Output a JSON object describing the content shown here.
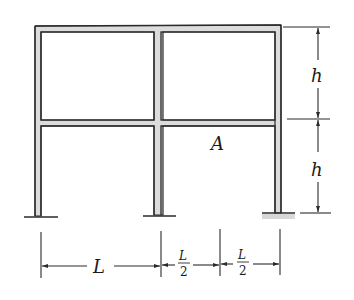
{
  "figure": {
    "type": "two-story two-bay portal frame",
    "colors": {
      "line": "#2a2a2a",
      "member_fill": "#d9d9d9",
      "background": "#ffffff"
    }
  },
  "labels": {
    "point_A": "A",
    "story_height_top": "h",
    "story_height_bottom": "h",
    "bay_left": "L",
    "bay_mid_num": "L",
    "bay_mid_den": "2",
    "bay_right_num": "L",
    "bay_right_den": "2"
  },
  "dimensions": {
    "vertical": [
      {
        "label": "h",
        "from": "roof",
        "to": "floor"
      },
      {
        "label": "h",
        "from": "floor",
        "to": "base"
      }
    ],
    "horizontal": [
      {
        "label": "L",
        "from": "left column",
        "to": "middle column"
      },
      {
        "label": "L/2",
        "from": "middle column",
        "to": "midpoint"
      },
      {
        "label": "L/2",
        "from": "midpoint",
        "to": "right column"
      }
    ]
  }
}
